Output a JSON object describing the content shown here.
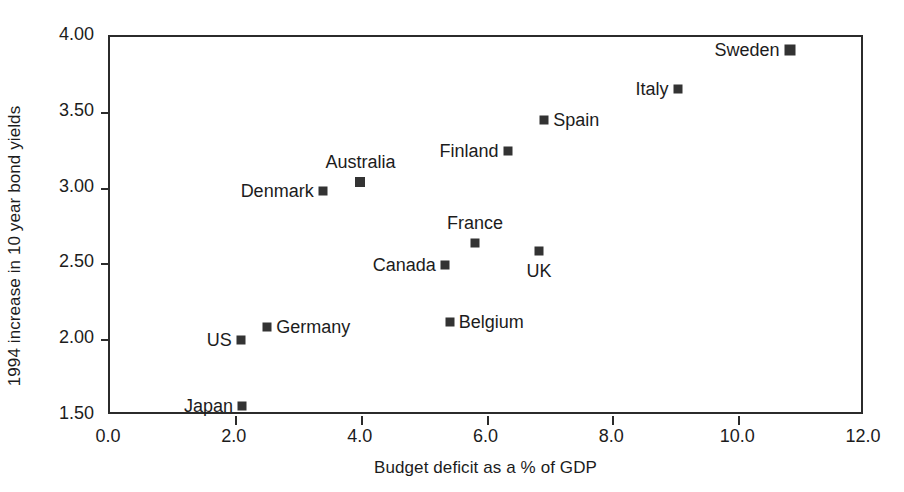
{
  "chart_data": {
    "type": "scatter",
    "title": "",
    "xlabel": "Budget deficit as a % of GDP",
    "ylabel": "1994 increase in 10 year bond yields",
    "xlim": [
      0.0,
      12.0
    ],
    "ylim": [
      1.5,
      4.0
    ],
    "xticks": [
      "0.0",
      "2.0",
      "4.0",
      "6.0",
      "8.0",
      "10.0",
      "12.0"
    ],
    "xtick_values": [
      0.0,
      2.0,
      4.0,
      6.0,
      8.0,
      10.0,
      12.0
    ],
    "yticks": [
      "1.50",
      "2.00",
      "2.50",
      "3.00",
      "3.50",
      "4.00"
    ],
    "ytick_values": [
      1.5,
      2.0,
      2.5,
      3.0,
      3.5,
      4.0
    ],
    "grid": false,
    "legend": "none",
    "marker_color": "#333333",
    "axis_color": "#2b2b2b",
    "points": [
      {
        "label": "Japan",
        "x": 2.1,
        "y": 1.565,
        "label_pos": "left",
        "size": 9
      },
      {
        "label": "US",
        "x": 2.08,
        "y": 2.0,
        "label_pos": "left",
        "size": 9
      },
      {
        "label": "Germany",
        "x": 2.5,
        "y": 2.09,
        "label_pos": "right",
        "size": 9
      },
      {
        "label": "Denmark",
        "x": 3.38,
        "y": 2.985,
        "label_pos": "left",
        "size": 9
      },
      {
        "label": "Australia",
        "x": 3.98,
        "y": 3.045,
        "label_pos": "above",
        "size": 10
      },
      {
        "label": "Belgium",
        "x": 5.4,
        "y": 2.12,
        "label_pos": "right",
        "size": 9
      },
      {
        "label": "Canada",
        "x": 5.32,
        "y": 2.495,
        "label_pos": "left",
        "size": 9
      },
      {
        "label": "France",
        "x": 5.8,
        "y": 2.64,
        "label_pos": "above",
        "size": 9
      },
      {
        "label": "Finland",
        "x": 6.32,
        "y": 3.25,
        "label_pos": "left",
        "size": 9
      },
      {
        "label": "UK",
        "x": 6.82,
        "y": 2.59,
        "label_pos": "below",
        "size": 9
      },
      {
        "label": "Spain",
        "x": 6.9,
        "y": 3.455,
        "label_pos": "right",
        "size": 9
      },
      {
        "label": "Italy",
        "x": 9.02,
        "y": 3.655,
        "label_pos": "left",
        "size": 9
      },
      {
        "label": "Sweden",
        "x": 10.8,
        "y": 3.915,
        "label_pos": "left",
        "size": 11
      }
    ]
  }
}
